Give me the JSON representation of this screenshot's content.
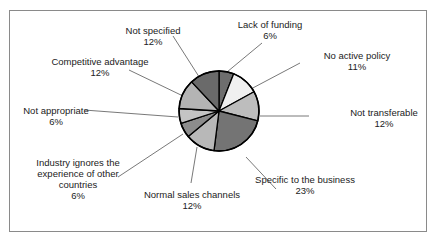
{
  "chart_data": {
    "type": "pie",
    "title": "",
    "center": [
      219,
      111
    ],
    "radius": 40,
    "start_angle_deg": 0,
    "direction": "clockwise",
    "slices": [
      {
        "label": "Lack of funding",
        "value": 6,
        "pct_label": "6%",
        "color": "#6e6e6e"
      },
      {
        "label": "No active policy",
        "value": 11,
        "pct_label": "11%",
        "color": "#f0f0f0"
      },
      {
        "label": "Not transferable",
        "value": 12,
        "pct_label": "12%",
        "color": "#bdbdbd"
      },
      {
        "label": "Specific to the business",
        "value": 23,
        "pct_label": "23%",
        "color": "#747474"
      },
      {
        "label": "Normal sales channels",
        "value": 12,
        "pct_label": "12%",
        "color": "#b8b8b8"
      },
      {
        "label": "Industry ignores the experience of other countries",
        "value": 6,
        "pct_label": "6%",
        "color": "#8c8c8c"
      },
      {
        "label": "Not appropriate",
        "value": 6,
        "pct_label": "6%",
        "color": "#c4c4c4"
      },
      {
        "label": "Competitive advantage",
        "value": 12,
        "pct_label": "12%",
        "color": "#b4b4b4"
      },
      {
        "label": "Not specified",
        "value": 12,
        "pct_label": "12%",
        "color": "#6a6a6a"
      }
    ],
    "legend": "none (callout labels)"
  },
  "labels": [
    {
      "lines": [
        "Lack of funding",
        "6%"
      ],
      "x": 270,
      "y": 19,
      "lx1": 262,
      "ly1": 43,
      "lx2": 227,
      "ly2": 72
    },
    {
      "lines": [
        "No active policy",
        "11%"
      ],
      "x": 357,
      "y": 50,
      "lx1": 300,
      "ly1": 63,
      "lx2": 249,
      "ly2": 90
    },
    {
      "lines": [
        "Not transferable",
        "12%"
      ],
      "x": 384,
      "y": 107,
      "lx1": 309,
      "ly1": 116,
      "lx2": 260,
      "ly2": 116
    },
    {
      "lines": [
        "Specific to the business",
        "23%"
      ],
      "x": 305,
      "y": 174,
      "lx1": 276,
      "ly1": 189,
      "lx2": 246,
      "ly2": 157
    },
    {
      "lines": [
        "Normal sales channels",
        "12%"
      ],
      "x": 192,
      "y": 189,
      "lx1": 191,
      "ly1": 183,
      "lx2": 197,
      "ly2": 147
    },
    {
      "lines": [
        "Industry ignores the",
        "experience of other",
        "countries",
        "6%"
      ],
      "x": 78,
      "y": 157,
      "lx1": 118,
      "ly1": 177,
      "lx2": 183,
      "ly2": 134
    },
    {
      "lines": [
        "Not appropriate",
        "6%"
      ],
      "x": 56,
      "y": 105,
      "lx1": 84,
      "ly1": 110,
      "lx2": 178,
      "ly2": 117
    },
    {
      "lines": [
        "Competitive advantage",
        "12%"
      ],
      "x": 100,
      "y": 56,
      "lx1": 129,
      "ly1": 70,
      "lx2": 183,
      "ly2": 96
    },
    {
      "lines": [
        "Not specified",
        "12%"
      ],
      "x": 153,
      "y": 25,
      "lx1": 173,
      "ly1": 36,
      "lx2": 203,
      "ly2": 83
    }
  ]
}
